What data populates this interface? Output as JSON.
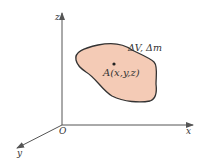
{
  "diagram": {
    "axes": {
      "x_label": "x",
      "y_label": "y",
      "z_label": "z",
      "origin_label": "O"
    },
    "region": {
      "label": "ΔV, Δm",
      "fill_color": "#f4cbb6",
      "stroke_color": "#333333"
    },
    "point": {
      "label": "A(x,y,z)"
    },
    "colors": {
      "axis": "#555555"
    }
  }
}
